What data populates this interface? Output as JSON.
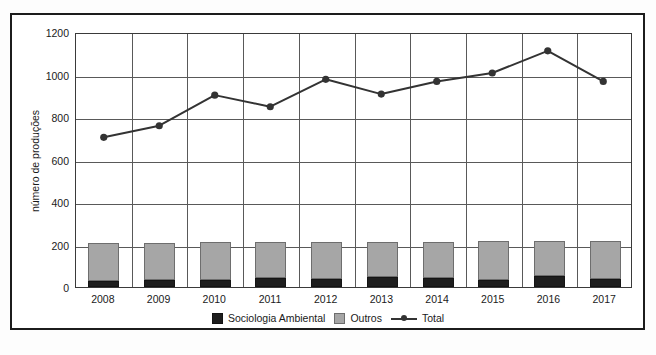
{
  "chart_data": {
    "type": "bar",
    "title": "",
    "subtitle": "",
    "xlabel": "",
    "ylabel": "número de produções",
    "categories": [
      "2008",
      "2009",
      "2010",
      "2011",
      "2012",
      "2013",
      "2014",
      "2015",
      "2016",
      "2017"
    ],
    "ylim": [
      0,
      1200
    ],
    "yticks": [
      0,
      200,
      400,
      600,
      800,
      1000,
      1200
    ],
    "ytick_labels": [
      "0",
      "200",
      "400",
      "600",
      "800",
      "1000",
      "1200"
    ],
    "grid": "horizontal-and-vertical",
    "legend_position": "bottom-center",
    "stacked": true,
    "series": [
      {
        "name": "Sociologia Ambiental",
        "type": "bar",
        "color": "#1e1e1e",
        "values": [
          28,
          34,
          34,
          42,
          40,
          48,
          44,
          32,
          52,
          38
        ]
      },
      {
        "name": "Outros",
        "type": "bar",
        "color": "#a6a6a6",
        "values": [
          177,
          172,
          177,
          168,
          172,
          166,
          170,
          184,
          163,
          177
        ]
      },
      {
        "name": "Total",
        "type": "line",
        "color": "#333333",
        "marker": "circle",
        "values": [
          710,
          765,
          910,
          855,
          985,
          915,
          975,
          1015,
          1120,
          975
        ]
      }
    ]
  },
  "legend": {
    "items": [
      {
        "label": "Sociologia Ambiental",
        "swatch": "square-dark"
      },
      {
        "label": "Outros",
        "swatch": "square-gray"
      },
      {
        "label": "Total",
        "swatch": "line-marker"
      }
    ]
  },
  "axes": {
    "y_title": "número de produções"
  }
}
